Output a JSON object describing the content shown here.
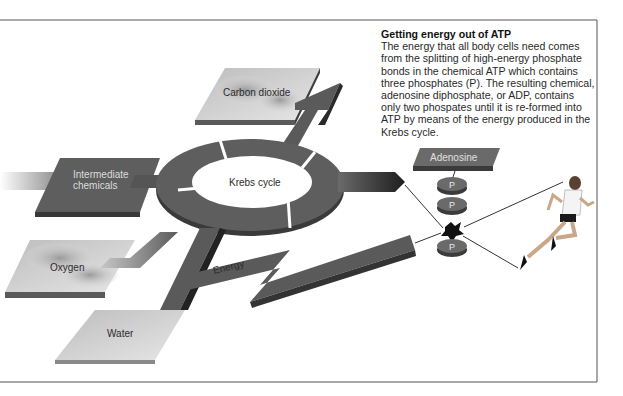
{
  "caption": {
    "title": "Getting energy out of ATP",
    "body": "The energy that all body cells need comes from the splitting of high-energy phosphate bonds in the chemical ATP which contains three phosphates (P). The resulting chemical, adenosine diphosphate, or ADP, contains only two phospates until it is re-formed into ATP by means of the energy produced in the Krebs cycle."
  },
  "diagram": {
    "center_label": "Krebs cycle",
    "inputs": [
      {
        "id": "intermediate",
        "label_line1": "Intermediate",
        "label_line2": "chemicals"
      },
      {
        "id": "oxygen",
        "label": "Oxygen"
      }
    ],
    "outputs": [
      {
        "id": "co2",
        "label": "Carbon dioxide"
      },
      {
        "id": "water",
        "label": "Water"
      },
      {
        "id": "energy",
        "label": "Energy"
      }
    ],
    "atp": {
      "adenosine_label": "Adenosine",
      "phosphates": [
        "P",
        "P",
        "P"
      ]
    },
    "figure": "runner"
  },
  "colors": {
    "pipe": "#555555",
    "pipe_dark": "#2e2e2e",
    "plate_light": "#cfcfcf",
    "border": "#555555"
  }
}
